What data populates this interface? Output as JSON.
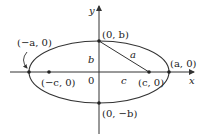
{
  "diagram": {
    "type": "ellipse-with-foci",
    "axes": {
      "x_label": "x",
      "y_label": "y",
      "origin_label": "0"
    },
    "points": {
      "left_vertex": "(−a, 0)",
      "right_vertex": "(a, 0)",
      "top_covertex": "(0, b)",
      "bottom_covertex": "(0, −b)",
      "left_focus": "(−c, 0)",
      "right_focus": "(c, 0)"
    },
    "segment_labels": {
      "a": "a",
      "b": "b",
      "c": "c"
    },
    "colors": {
      "stroke": "#333333",
      "background": "#ffffff"
    }
  }
}
